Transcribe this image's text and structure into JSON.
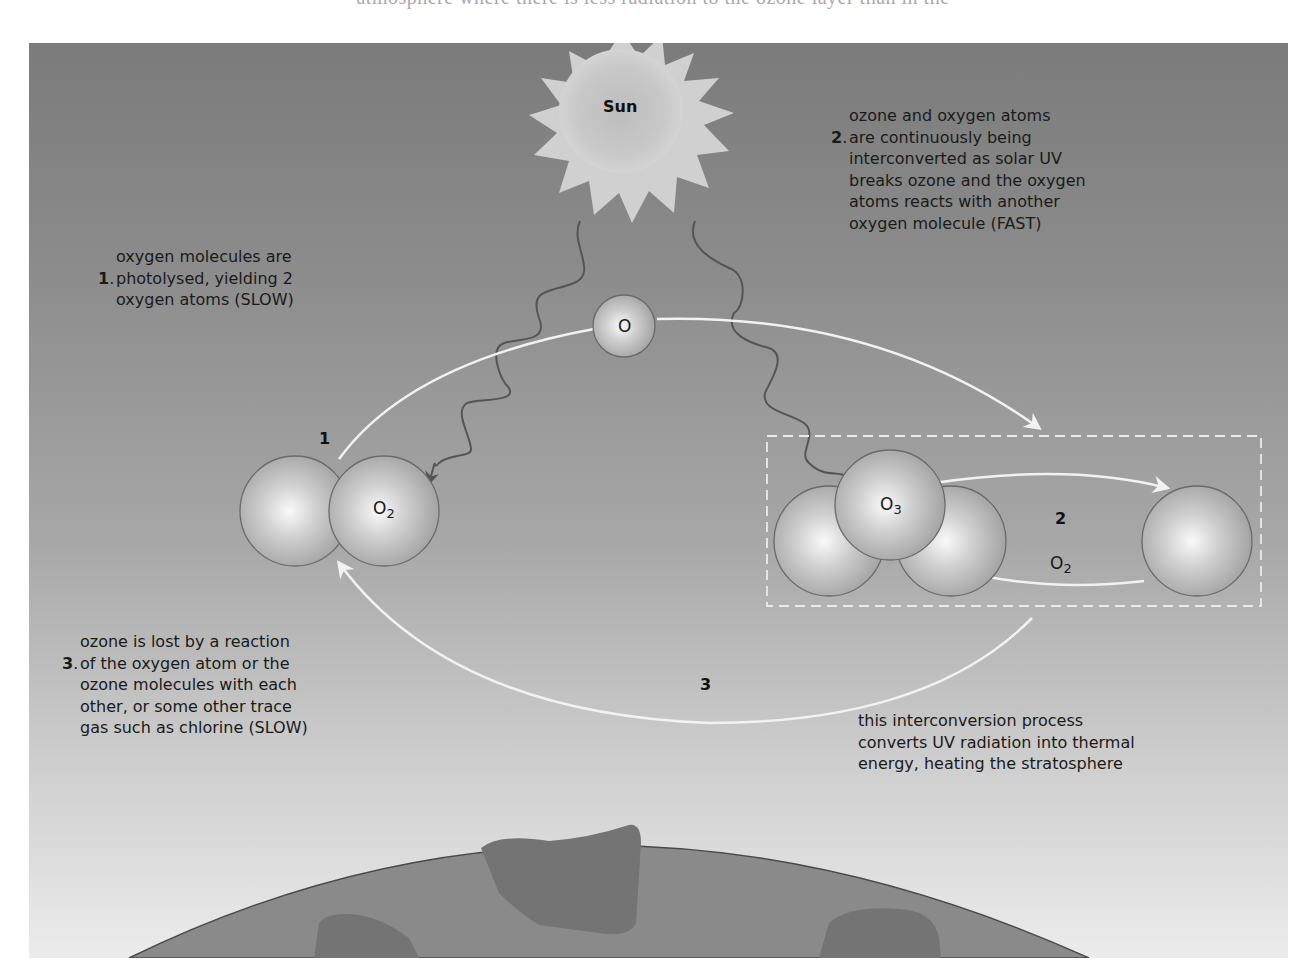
{
  "header_partial_text": "atmosphere where there is less radiation to the ozone layer than in the",
  "diagram": {
    "colors": {
      "panel_top": "#7b7b7b",
      "panel_bottom": "#ececec",
      "earth_fill": "#8a8a8a",
      "continent_fill": "#737373",
      "arrow_white": "#f2f2f2",
      "uv_wave": "#555555",
      "sun_fill": "#c4c4c4"
    },
    "sun": {
      "label": "Sun"
    },
    "single_atom": {
      "label": "O"
    },
    "o2_molecule": {
      "label": "O",
      "subscript": "2"
    },
    "o3_molecule": {
      "label": "O",
      "subscript": "3"
    },
    "o2_product": {
      "label": "O",
      "subscript": "2"
    },
    "steps": {
      "step1_marker": "1",
      "step2_marker": "2",
      "step3_marker": "3"
    },
    "notes": [
      {
        "number": "1",
        "text": "oxygen molecules are\nphotolysed, yielding 2\noxygen atoms (SLOW)"
      },
      {
        "number": "2",
        "text": "ozone and oxygen atoms\nare continuously being\ninterconverted as solar UV\nbreaks ozone and the oxygen\natoms reacts with another\noxygen molecule (FAST)"
      },
      {
        "number": "3",
        "text": "ozone is lost by a reaction\nof the oxygen atom or the\nozone molecules with each\nother, or some other trace\ngas such as chlorine (SLOW)"
      }
    ],
    "summary_note": "this interconversion process\nconverts UV radiation into thermal\nenergy, heating the stratosphere"
  }
}
